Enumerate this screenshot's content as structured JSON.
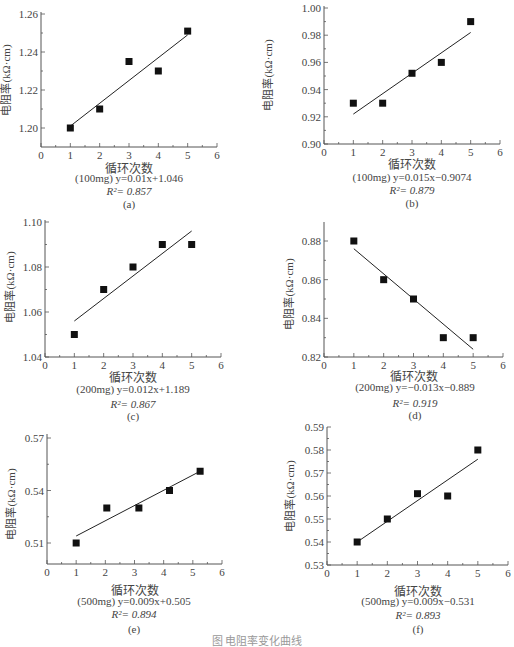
{
  "figure_caption": "图 电阻率变化曲线",
  "chart_data": [
    {
      "id": "a",
      "type": "scatter",
      "title": "",
      "panel_label": "(a)",
      "xlabel": "循环次数",
      "ylabel": "电阻率(kΩ·cm)",
      "x": [
        1,
        2,
        3,
        4,
        5
      ],
      "values": [
        1.2,
        1.21,
        1.235,
        1.23,
        1.251
      ],
      "xlim": [
        0,
        6
      ],
      "ylim": [
        1.19,
        1.26
      ],
      "xticks": [
        "0",
        "1",
        "2",
        "3",
        "4",
        "5",
        "6"
      ],
      "yticks": [
        "1.20",
        "1.22",
        "1.24",
        "1.26"
      ],
      "fit": {
        "from": [
          1,
          1.201
        ],
        "to": [
          5,
          1.249
        ]
      },
      "equation": "(100mg) y=0.01x+1.046",
      "r2": "R²= 0.857",
      "grid": false,
      "legend": "none"
    },
    {
      "id": "b",
      "type": "scatter",
      "title": "",
      "panel_label": "(b)",
      "xlabel": "循环次数",
      "ylabel": "电阻率(kΩ·cm)",
      "x": [
        1,
        2,
        3,
        4,
        5
      ],
      "values": [
        0.93,
        0.93,
        0.952,
        0.96,
        0.99
      ],
      "xlim": [
        0,
        6
      ],
      "ylim": [
        0.9,
        1.0
      ],
      "xticks": [
        "0",
        "1",
        "2",
        "3",
        "4",
        "5",
        "6"
      ],
      "yticks": [
        "0.90",
        "0.92",
        "0.94",
        "0.96",
        "0.98",
        "1.00"
      ],
      "fit": {
        "from": [
          1,
          0.922
        ],
        "to": [
          5,
          0.982
        ]
      },
      "equation": "(100mg) y=0.015x−0.9074",
      "r2": "R²= 0.879",
      "grid": false,
      "legend": "none"
    },
    {
      "id": "c",
      "type": "scatter",
      "title": "",
      "panel_label": "(c)",
      "xlabel": "循环次数",
      "ylabel": "电阻率(kΩ·cm)",
      "x": [
        1,
        2,
        3,
        4,
        5
      ],
      "values": [
        1.05,
        1.07,
        1.08,
        1.09,
        1.09
      ],
      "xlim": [
        0,
        6
      ],
      "ylim": [
        1.04,
        1.1
      ],
      "xticks": [
        "0",
        "1",
        "2",
        "3",
        "4",
        "5",
        "6"
      ],
      "yticks": [
        "1.04",
        "1.06",
        "1.08",
        "1.10"
      ],
      "fit": {
        "from": [
          1,
          1.056
        ],
        "to": [
          5,
          1.096
        ]
      },
      "equation": "(200mg) y=0.012x+1.189",
      "r2": "R²= 0.867",
      "grid": false,
      "legend": "none"
    },
    {
      "id": "d",
      "type": "scatter",
      "title": "",
      "panel_label": "(d)",
      "xlabel": "循环次数",
      "ylabel": "电阻率(kΩ·cm)",
      "x": [
        1,
        2,
        3,
        4,
        5
      ],
      "values": [
        0.88,
        0.86,
        0.85,
        0.83,
        0.83
      ],
      "xlim": [
        0,
        6
      ],
      "ylim": [
        0.82,
        0.89
      ],
      "xticks": [
        "0",
        "1",
        "2",
        "3",
        "4",
        "5",
        "6"
      ],
      "yticks": [
        "0.82",
        "0.84",
        "0.86",
        "0.88"
      ],
      "fit": {
        "from": [
          1,
          0.876
        ],
        "to": [
          5,
          0.824
        ]
      },
      "equation": "(200mg) y=−0.013x−0.889",
      "r2": "R²= 0.919",
      "grid": false,
      "legend": "none"
    },
    {
      "id": "e",
      "type": "scatter",
      "title": "",
      "panel_label": "(e)",
      "xlabel": "循环次数",
      "ylabel": "电阻率(kΩ·cm)",
      "x": [
        1,
        2.05,
        3.15,
        4.2,
        5.25
      ],
      "values": [
        0.51,
        0.53,
        0.53,
        0.54,
        0.551
      ],
      "xlim": [
        0,
        6
      ],
      "ylim": [
        0.5,
        0.57
      ],
      "xticks": [
        "0",
        "1",
        "2",
        "3",
        "4",
        "5",
        "6"
      ],
      "yticks": [
        "0.51",
        "0.54",
        "0.57"
      ],
      "fit": {
        "from": [
          1,
          0.514
        ],
        "to": [
          5.25,
          0.551
        ]
      },
      "equation": "(500mg) y=0.009x+0.505",
      "r2": "R²= 0.894",
      "grid": false,
      "legend": "none"
    },
    {
      "id": "f",
      "type": "scatter",
      "title": "",
      "panel_label": "(f)",
      "xlabel": "循环次数",
      "ylabel": "电阻率(kΩ·cm)",
      "x": [
        1,
        2,
        3,
        4,
        5
      ],
      "values": [
        0.54,
        0.55,
        0.561,
        0.56,
        0.58
      ],
      "xlim": [
        0,
        6
      ],
      "ylim": [
        0.53,
        0.59
      ],
      "xticks": [
        "0",
        "1",
        "2",
        "3",
        "4",
        "5",
        "6"
      ],
      "yticks": [
        "0.53",
        "0.54",
        "0.55",
        "0.56",
        "0.57",
        "0.58",
        "0.59"
      ],
      "fit": {
        "from": [
          1,
          0.54
        ],
        "to": [
          5,
          0.576
        ]
      },
      "equation": "(500mg) y=0.009x−0.531",
      "r2": "R²= 0.893",
      "grid": false,
      "legend": "none"
    }
  ]
}
